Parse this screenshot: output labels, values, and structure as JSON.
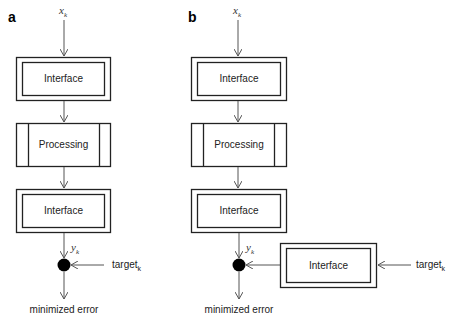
{
  "panels": [
    {
      "label": "a",
      "input": {
        "var": "x",
        "sub": "k"
      },
      "blocks": [
        {
          "type": "interface",
          "label": "Interface"
        },
        {
          "type": "processing",
          "label": "Processing"
        },
        {
          "type": "interface",
          "label": "Interface"
        }
      ],
      "output": {
        "var": "y",
        "sub": "k"
      },
      "target": {
        "text": "target",
        "sub": "k"
      },
      "result": "minimized error"
    },
    {
      "label": "b",
      "input": {
        "var": "x",
        "sub": "k"
      },
      "blocks": [
        {
          "type": "interface",
          "label": "Interface"
        },
        {
          "type": "processing",
          "label": "Processing"
        },
        {
          "type": "interface",
          "label": "Interface"
        }
      ],
      "target_block": {
        "type": "interface",
        "label": "Interface"
      },
      "output": {
        "var": "y",
        "sub": "k"
      },
      "target": {
        "text": "target",
        "sub": "k"
      },
      "result": "minimized error"
    }
  ]
}
